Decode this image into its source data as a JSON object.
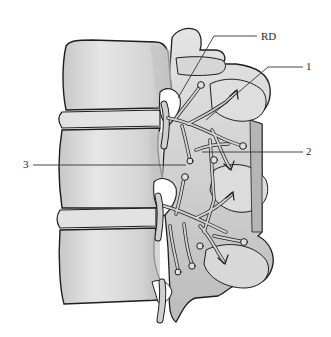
{
  "figure": {
    "colors": {
      "bone_fill": "#d9d9d9",
      "bone_light": "#ececec",
      "bone_shadow": "#a8a8a8",
      "outline": "#1e1e1e",
      "nerve_fill": "#c4c4c4",
      "leader_line": "#333333",
      "background": "#ffffff"
    },
    "labels": [
      {
        "id": "RD",
        "text": "RD"
      },
      {
        "id": "1",
        "text": "1"
      },
      {
        "id": "2",
        "text": "2"
      },
      {
        "id": "3",
        "text": "3"
      }
    ]
  }
}
